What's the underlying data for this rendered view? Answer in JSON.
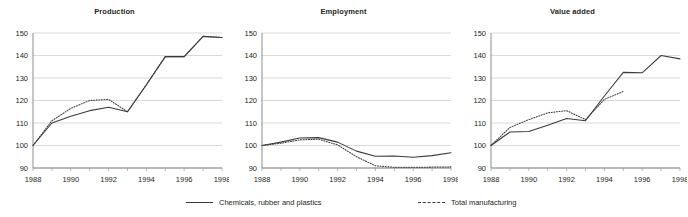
{
  "figure": {
    "width": 688,
    "height": 217,
    "background": "#ffffff",
    "line_color": "#3b3b3b",
    "grid_color": "#c8c8c8"
  },
  "legend": {
    "position": "bottom-center",
    "entries": [
      {
        "label": "Chemicals, rubber and plastics",
        "style": "solid"
      },
      {
        "label": "Total manufacturing",
        "style": "dashed"
      }
    ]
  },
  "chart_data": [
    {
      "type": "line",
      "title": "Production",
      "xlabel": "",
      "ylabel": "",
      "xlim": [
        1988,
        1998
      ],
      "ylim": [
        90,
        150
      ],
      "yticks": [
        90,
        100,
        110,
        120,
        130,
        140,
        150
      ],
      "xticks": [
        1988,
        1990,
        1992,
        1994,
        1996,
        1998
      ],
      "xtick_labels": [
        "1988",
        "1990",
        "1992",
        "1994",
        "1996",
        "1998"
      ],
      "grid": true,
      "x": [
        1988,
        1989,
        1990,
        1991,
        1992,
        1993,
        1994,
        1995,
        1996,
        1997,
        1998
      ],
      "series": [
        {
          "name": "Chemicals, rubber and plastics",
          "style": "solid",
          "values": [
            100.0,
            110.0,
            113.0,
            115.5,
            117.0,
            115.0,
            127.0,
            139.5,
            139.5,
            148.5,
            148.0
          ]
        },
        {
          "name": "Total manufacturing",
          "style": "dashed",
          "values": [
            100.0,
            111.0,
            116.5,
            120.0,
            120.5,
            115.0,
            127.0,
            139.5,
            139.5,
            148.5,
            148.0
          ]
        }
      ]
    },
    {
      "type": "line",
      "title": "Employment",
      "xlabel": "",
      "ylabel": "",
      "xlim": [
        1988,
        1998
      ],
      "ylim": [
        90,
        150
      ],
      "yticks": [
        90,
        100,
        110,
        120,
        130,
        140,
        150
      ],
      "xticks": [
        1988,
        1990,
        1992,
        1994,
        1996,
        1998
      ],
      "xtick_labels": [
        "1988",
        "1990",
        "1992",
        "1994",
        "1996",
        "1998"
      ],
      "grid": true,
      "x": [
        1988,
        1989,
        1990,
        1991,
        1992,
        1993,
        1994,
        1995,
        1996,
        1997,
        1998
      ],
      "series": [
        {
          "name": "Chemicals, rubber and plastics",
          "style": "solid",
          "values": [
            100.0,
            101.5,
            103.3,
            103.5,
            101.5,
            97.5,
            95.2,
            95.3,
            94.8,
            95.5,
            96.8
          ]
        },
        {
          "name": "Total manufacturing",
          "style": "dashed",
          "values": [
            100.0,
            101.0,
            102.5,
            102.8,
            100.3,
            95.0,
            91.0,
            90.3,
            90.3,
            90.4,
            90.5
          ]
        }
      ]
    },
    {
      "type": "line",
      "title": "Value added",
      "xlabel": "",
      "ylabel": "",
      "xlim": [
        1988,
        1998
      ],
      "ylim": [
        90,
        150
      ],
      "yticks": [
        90,
        100,
        110,
        120,
        130,
        140,
        150
      ],
      "xticks": [
        1988,
        1990,
        1992,
        1994,
        1996,
        1998
      ],
      "xtick_labels": [
        "1988",
        "1990",
        "1992",
        "1994",
        "1996",
        "1998"
      ],
      "grid": true,
      "x": [
        1988,
        1989,
        1990,
        1991,
        1992,
        1993,
        1994,
        1995,
        1996,
        1997,
        1998
      ],
      "series": [
        {
          "name": "Chemicals, rubber and plastics",
          "style": "solid",
          "values": [
            100.0,
            106.0,
            106.2,
            109.0,
            112.0,
            111.0,
            122.0,
            132.5,
            132.3,
            140.0,
            138.5
          ]
        },
        {
          "name": "Total manufacturing",
          "style": "dashed",
          "values": [
            100.0,
            108.0,
            111.5,
            114.5,
            115.5,
            111.5,
            120.5,
            124.0,
            null,
            null,
            null
          ]
        }
      ]
    }
  ]
}
